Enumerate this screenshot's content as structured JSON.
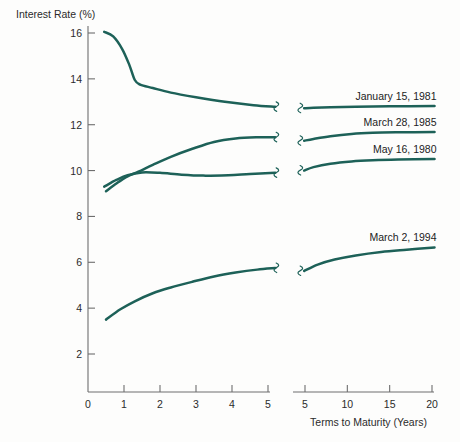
{
  "chart_data": {
    "type": "line",
    "title": "",
    "xlabel": "Terms to Maturity (Years)",
    "ylabel": "Interest Rate (%)",
    "ylim": [
      0,
      17
    ],
    "y_ticks": [
      2,
      4,
      6,
      8,
      10,
      12,
      14,
      16
    ],
    "grid": false,
    "legend_position": "inline-right-of-curve",
    "axis_break": true,
    "x_axis_segments": [
      {
        "name": "left",
        "ticks": [
          0,
          1,
          2,
          3,
          4,
          5
        ],
        "range": [
          0,
          5.3
        ]
      },
      {
        "name": "right",
        "ticks": [
          5,
          10,
          15,
          20
        ],
        "range": [
          4.6,
          20.6
        ]
      }
    ],
    "series_color": "#1d6158",
    "series": [
      {
        "name": "January 15, 1981",
        "label": "January 15, 1981",
        "left_points": [
          [
            0.45,
            16.05
          ],
          [
            0.7,
            15.85
          ],
          [
            0.95,
            15.3
          ],
          [
            1.15,
            14.6
          ],
          [
            1.3,
            13.95
          ],
          [
            1.45,
            13.75
          ],
          [
            1.8,
            13.6
          ],
          [
            2.3,
            13.4
          ],
          [
            3.0,
            13.2
          ],
          [
            3.8,
            13.0
          ],
          [
            4.6,
            12.85
          ],
          [
            5.2,
            12.78
          ]
        ],
        "right_points": [
          [
            4.9,
            12.72
          ],
          [
            6.0,
            12.74
          ],
          [
            8.0,
            12.76
          ],
          [
            11.0,
            12.78
          ],
          [
            15.0,
            12.8
          ],
          [
            20.3,
            12.82
          ]
        ]
      },
      {
        "name": "March 28, 1985",
        "label": "March 28, 1985",
        "left_points": [
          [
            0.5,
            9.1
          ],
          [
            0.8,
            9.45
          ],
          [
            1.1,
            9.75
          ],
          [
            1.4,
            9.95
          ],
          [
            1.8,
            10.25
          ],
          [
            2.3,
            10.6
          ],
          [
            2.9,
            10.95
          ],
          [
            3.5,
            11.25
          ],
          [
            4.1,
            11.4
          ],
          [
            4.7,
            11.45
          ],
          [
            5.2,
            11.45
          ]
        ],
        "right_points": [
          [
            4.9,
            11.3
          ],
          [
            6.0,
            11.38
          ],
          [
            8.0,
            11.5
          ],
          [
            10.5,
            11.6
          ],
          [
            13.0,
            11.65
          ],
          [
            16.0,
            11.67
          ],
          [
            20.3,
            11.68
          ]
        ]
      },
      {
        "name": "May 16, 1980",
        "label": "May 16, 1980",
        "left_points": [
          [
            0.45,
            9.3
          ],
          [
            0.8,
            9.6
          ],
          [
            1.1,
            9.8
          ],
          [
            1.5,
            9.92
          ],
          [
            2.0,
            9.9
          ],
          [
            2.6,
            9.82
          ],
          [
            3.2,
            9.78
          ],
          [
            3.9,
            9.8
          ],
          [
            4.5,
            9.85
          ],
          [
            5.2,
            9.9
          ]
        ],
        "right_points": [
          [
            4.9,
            10.0
          ],
          [
            6.0,
            10.15
          ],
          [
            8.0,
            10.3
          ],
          [
            10.5,
            10.4
          ],
          [
            13.0,
            10.45
          ],
          [
            16.0,
            10.48
          ],
          [
            20.3,
            10.5
          ]
        ]
      },
      {
        "name": "March 2, 1994",
        "label": "March 2, 1994",
        "left_points": [
          [
            0.5,
            3.5
          ],
          [
            0.9,
            3.95
          ],
          [
            1.3,
            4.3
          ],
          [
            1.8,
            4.65
          ],
          [
            2.3,
            4.9
          ],
          [
            2.9,
            5.15
          ],
          [
            3.5,
            5.38
          ],
          [
            4.1,
            5.55
          ],
          [
            4.7,
            5.68
          ],
          [
            5.2,
            5.75
          ]
        ],
        "right_points": [
          [
            4.9,
            5.62
          ],
          [
            6.5,
            5.9
          ],
          [
            8.5,
            6.12
          ],
          [
            11.0,
            6.3
          ],
          [
            14.0,
            6.45
          ],
          [
            17.0,
            6.55
          ],
          [
            20.3,
            6.65
          ]
        ]
      }
    ]
  },
  "labels": {
    "y_axis_title": "Interest Rate (%)",
    "x_axis_title": "Terms to Maturity (Years)",
    "y_ticks": [
      "16",
      "14",
      "12",
      "10",
      "8",
      "6",
      "4",
      "2"
    ],
    "x_ticks_left": [
      "0",
      "1",
      "2",
      "3",
      "4",
      "5"
    ],
    "x_ticks_right": [
      "5",
      "10",
      "15",
      "20"
    ],
    "series": [
      "January 15, 1981",
      "March 28, 1985",
      "May 16, 1980",
      "March 2, 1994"
    ]
  },
  "colors": {
    "curve": "#1d6158",
    "axis": "#6e6e6e",
    "text": "#2b2b2b",
    "background": "#fdfdfc"
  }
}
